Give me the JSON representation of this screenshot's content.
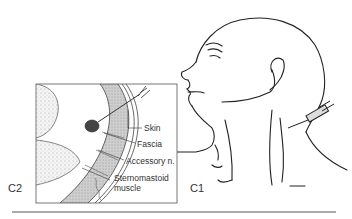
{
  "figure": {
    "panels": [
      {
        "id": "C1",
        "label": "C1"
      },
      {
        "id": "C2",
        "label": "C2"
      }
    ],
    "inset_labels": {
      "skin": "Skin",
      "fascia": "Fascia",
      "accessory": "Accessory n.",
      "sternomastoid_line1": "Sternomastoid",
      "sternomastoid_line2": "muscle"
    }
  }
}
